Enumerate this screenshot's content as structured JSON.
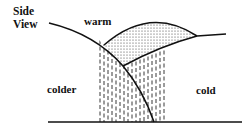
{
  "diagram": {
    "title_line1": "Side",
    "title_line2": "View",
    "labels": {
      "warm": "warm",
      "colder": "colder",
      "cold": "cold"
    },
    "colors": {
      "stroke": "#111111",
      "background": "#ffffff"
    },
    "regions": [
      {
        "name": "warm-air-mass",
        "fill": "dotted stipple"
      },
      {
        "name": "precipitation",
        "fill": "vertical dashed hatching"
      }
    ]
  }
}
